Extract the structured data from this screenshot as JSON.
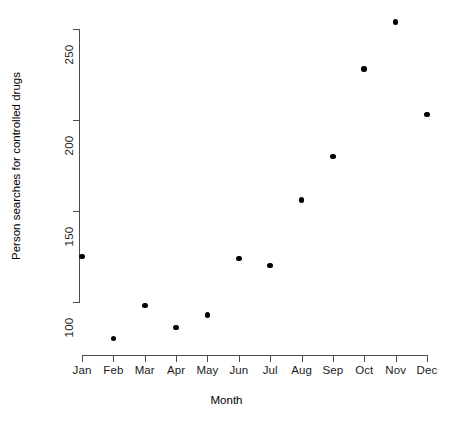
{
  "chart_data": {
    "type": "scatter",
    "title": "",
    "xlabel": "Month",
    "ylabel": "Person searches for controlled drugs",
    "categories": [
      "Jan",
      "Feb",
      "Mar",
      "Apr",
      "May",
      "Jun",
      "Jul",
      "Aug",
      "Sep",
      "Oct",
      "Nov",
      "Dec"
    ],
    "values": [
      125,
      80,
      98,
      86,
      93,
      124,
      120,
      156,
      180,
      228,
      254,
      203
    ],
    "series": [
      {
        "name": "Person searches for controlled drugs",
        "values": [
          125,
          80,
          98,
          86,
          93,
          124,
          120,
          156,
          180,
          228,
          254,
          203
        ]
      }
    ],
    "points": [
      {
        "x": "Jan",
        "y": 125
      },
      {
        "x": "Feb",
        "y": 80
      },
      {
        "x": "Mar",
        "y": 98
      },
      {
        "x": "Apr",
        "y": 86
      },
      {
        "x": "May",
        "y": 93
      },
      {
        "x": "Jun",
        "y": 124
      },
      {
        "x": "Jul",
        "y": 120
      },
      {
        "x": "Aug",
        "y": 156
      },
      {
        "x": "Sep",
        "y": 180
      },
      {
        "x": "Oct",
        "y": 228
      },
      {
        "x": "Nov",
        "y": 254
      },
      {
        "x": "Dec",
        "y": 203
      }
    ],
    "y_ticks": [
      100,
      150,
      200,
      250
    ],
    "y_tick_labels": [
      "100",
      "150",
      "200",
      "250"
    ],
    "x_tick_labels": [
      "Jan",
      "Feb",
      "Mar",
      "Apr",
      "May",
      "Jun",
      "Jul",
      "Aug",
      "Sep",
      "Oct",
      "Nov",
      "Dec"
    ],
    "ylim": [
      80,
      254
    ],
    "axis_range_y": [
      100,
      250
    ],
    "grid": false,
    "legend": false,
    "legend_position": "none",
    "marker": "filled-circle",
    "marker_color": "#000000",
    "axis_color": "#4d4d4d",
    "background_color": "#ffffff"
  },
  "layout": {
    "plot_left_px": 82,
    "plot_right_px": 427,
    "y_pixel_at_100": 302,
    "y_pixel_at_250": 29,
    "x_axis_baseline_px": 355
  }
}
